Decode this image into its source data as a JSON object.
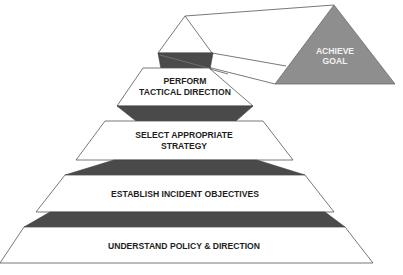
{
  "diagram": {
    "goal": {
      "label_line1": "ACHIEVE",
      "label_line2": "GOAL",
      "fill_color": "#8e8e8e"
    },
    "tiers": [
      {
        "id": "perform",
        "line1": "PERFORM",
        "line2": "TACTICAL DIRECTION"
      },
      {
        "id": "select",
        "line1": "SELECT APPROPRIATE",
        "line2": "STRATEGY"
      },
      {
        "id": "establish",
        "line1": "ESTABLISH INCIDENT OBJECTIVES"
      },
      {
        "id": "understand",
        "line1": "UNDERSTAND POLICY & DIRECTION"
      }
    ],
    "colors": {
      "band": "#4a4a4a",
      "outline": "#555555",
      "background": "#ffffff"
    }
  }
}
